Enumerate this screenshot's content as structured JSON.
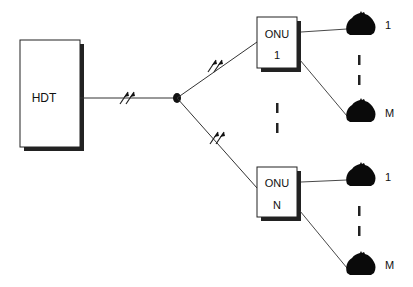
{
  "diagram": {
    "type": "point-to-multipoint optical access network",
    "colors": {
      "line": "#333333",
      "box_fill": "#ffffff",
      "shadow": "#222222",
      "node": "#111111"
    },
    "hdt": {
      "label": "HDT"
    },
    "splitter": {
      "label": ""
    },
    "onus": [
      {
        "label": "ONU",
        "index": "1",
        "phones": [
          {
            "label": "1"
          },
          {
            "label": "M"
          }
        ]
      },
      {
        "label": "ONU",
        "index": "N",
        "phones": [
          {
            "label": "1"
          },
          {
            "label": "M"
          }
        ]
      }
    ],
    "ellipsis_markers": [
      "between-onus",
      "between-phones-onu1",
      "between-phones-onuN"
    ],
    "icons": {
      "phone": "telephone-icon",
      "signal": "optical-signal-arrows-icon"
    }
  }
}
